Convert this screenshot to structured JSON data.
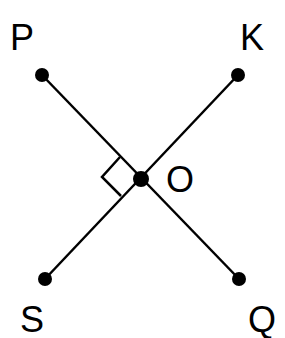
{
  "diagram": {
    "type": "geometry",
    "labels": {
      "P": "P",
      "K": "K",
      "O": "O",
      "S": "S",
      "Q": "Q"
    },
    "points": {
      "P": {
        "x": 42,
        "y": 75
      },
      "K": {
        "x": 238,
        "y": 75
      },
      "O": {
        "x": 141,
        "y": 179
      },
      "S": {
        "x": 45,
        "y": 279
      },
      "Q": {
        "x": 239,
        "y": 279
      }
    },
    "segments": [
      [
        "P",
        "Q"
      ],
      [
        "K",
        "S"
      ]
    ],
    "right_angle_at": "O",
    "color": "#000000"
  }
}
